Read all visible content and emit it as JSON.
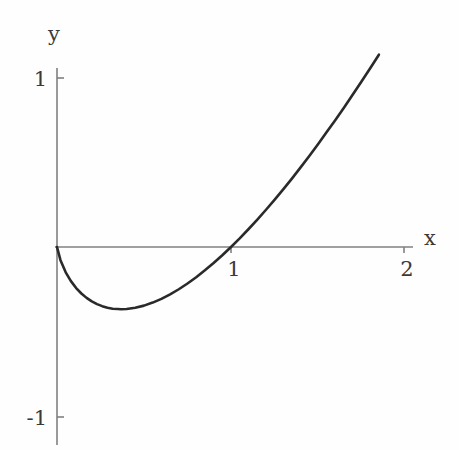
{
  "figure": {
    "background_color": "#fefefe",
    "axis_color": "#808080",
    "curve_color": "#2a2a2a",
    "text_color": "#3a3a3a"
  },
  "labels": {
    "x_axis": "x",
    "y_axis": "y"
  },
  "ticks": {
    "x": [
      "1",
      "2"
    ],
    "y": [
      "1",
      "-1"
    ]
  },
  "chart_data": {
    "type": "line",
    "title": "",
    "xlabel": "x",
    "ylabel": "y",
    "xlim": [
      0,
      2.05
    ],
    "ylim": [
      -1.1,
      1.2
    ],
    "xticks": [
      1,
      2
    ],
    "xticklabels": [
      "1",
      "2"
    ],
    "yticks": [
      1,
      -1
    ],
    "yticklabels": [
      "1",
      "-1"
    ],
    "grid": false,
    "legend": false,
    "legend_position": "none",
    "axes_style": "centered-arrowless-spines",
    "annotations": [
      {
        "text": "curve passes through origin (0, 0)",
        "x": 0,
        "y": 0
      },
      {
        "text": "minimum of curve",
        "x": 0.368,
        "y": -0.368
      },
      {
        "text": "root at x = 1",
        "x": 1,
        "y": 0
      }
    ],
    "series": [
      {
        "name": "x ln(x)",
        "x": [
          0.0,
          0.02,
          0.05,
          0.08,
          0.11,
          0.14,
          0.17,
          0.2,
          0.23,
          0.26,
          0.29,
          0.32,
          0.35,
          0.368,
          0.4,
          0.45,
          0.5,
          0.55,
          0.6,
          0.65,
          0.7,
          0.75,
          0.8,
          0.85,
          0.9,
          0.95,
          1.0,
          1.05,
          1.1,
          1.15,
          1.2,
          1.25,
          1.3,
          1.35,
          1.4,
          1.45,
          1.5,
          1.55,
          1.6,
          1.65,
          1.7,
          1.75,
          1.8,
          1.85
        ],
        "y": [
          0.0,
          -0.078,
          -0.15,
          -0.202,
          -0.243,
          -0.275,
          -0.301,
          -0.322,
          -0.338,
          -0.35,
          -0.359,
          -0.365,
          -0.367,
          -0.368,
          -0.367,
          -0.359,
          -0.347,
          -0.329,
          -0.307,
          -0.28,
          -0.25,
          -0.216,
          -0.179,
          -0.138,
          -0.095,
          -0.049,
          0.0,
          0.051,
          0.105,
          0.161,
          0.219,
          0.279,
          0.341,
          0.405,
          0.471,
          0.539,
          0.608,
          0.68,
          0.752,
          0.826,
          0.902,
          0.979,
          1.058,
          1.138
        ]
      }
    ]
  }
}
